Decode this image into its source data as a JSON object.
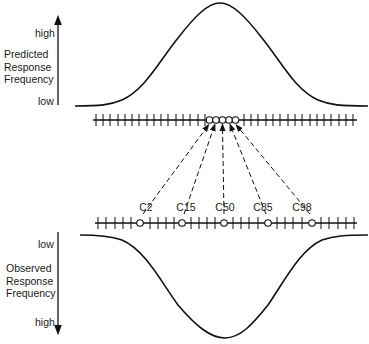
{
  "top_panel": {
    "axis_title_lines": [
      "Predicted",
      "Response",
      "Frequency"
    ],
    "high_label": "high",
    "low_label": "low",
    "curve": "bell (normal distribution, peak up)"
  },
  "bottom_panel": {
    "axis_title_lines": [
      "Observed",
      "Response",
      "Frequency"
    ],
    "low_label": "low",
    "high_label": "high",
    "curve": "inverted bell (peak down)"
  },
  "category_points": [
    {
      "label": "C2"
    },
    {
      "label": "C15"
    },
    {
      "label": "C50"
    },
    {
      "label": "C85"
    },
    {
      "label": "C98"
    }
  ],
  "colors": {
    "ink": "#111111",
    "background": "#ffffff"
  }
}
